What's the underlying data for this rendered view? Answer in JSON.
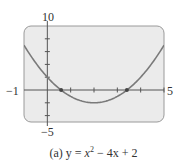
{
  "chart_data": {
    "type": "line",
    "title": "",
    "caption_prefix": "(a)",
    "caption": "(a) y = x² − 4x + 2",
    "equation": "y = x^2 - 4x + 2",
    "xlabel": "",
    "ylabel": "",
    "xlim": [
      -1,
      5
    ],
    "ylim": [
      -5,
      10
    ],
    "grid": false,
    "legend": null,
    "axis_labels": {
      "xmin": "−1",
      "xmax": "5",
      "ymin": "−5",
      "ymax": "10"
    },
    "x_ticks": [
      1,
      2,
      3,
      4,
      5
    ],
    "y_ticks": [
      -4,
      -2,
      2,
      4,
      6,
      8
    ],
    "series": [
      {
        "name": "y = x^2 - 4x + 2",
        "x": [
          -1,
          -0.5,
          0,
          0.5,
          1,
          1.5,
          2,
          2.5,
          3,
          3.5,
          4,
          4.5,
          5
        ],
        "y": [
          7,
          4.25,
          2,
          0.25,
          -1,
          -1.75,
          -2,
          -1.75,
          -1,
          0.25,
          2,
          4.25,
          7
        ]
      }
    ],
    "marked_points": [
      {
        "label": "root",
        "x": 0.59,
        "y": 0
      },
      {
        "label": "root",
        "x": 3.41,
        "y": 0
      }
    ],
    "vertex": {
      "x": 2,
      "y": -2
    },
    "colors": {
      "frame_fill": "#ebebeb",
      "frame_border": "#9a9a9a",
      "curve": "#7a7a7a",
      "axis": "#555555"
    }
  },
  "labels": {
    "ymax": "10",
    "ymin": "−5",
    "xmin": "−1",
    "xmax": "5"
  },
  "caption": {
    "prefix": "(a)",
    "lhs": "y",
    "eq": "=",
    "x": "x",
    "sup": "2",
    "minus": "−",
    "term": "4x",
    "plus": "+",
    "const": "2"
  }
}
